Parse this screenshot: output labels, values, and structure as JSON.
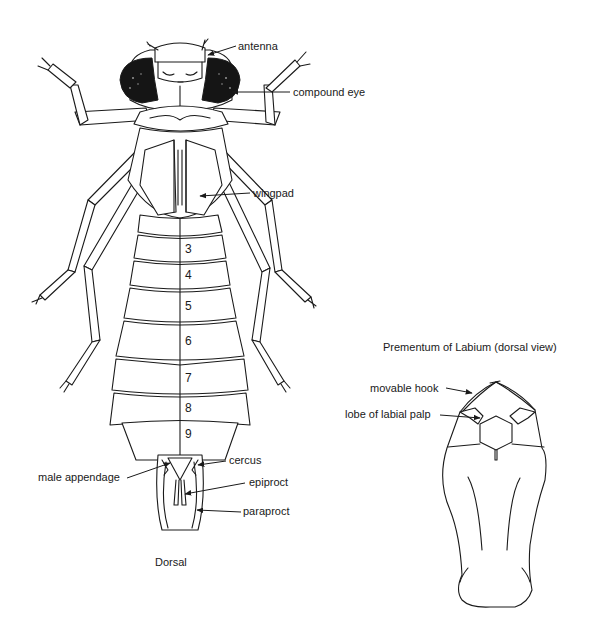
{
  "figure": {
    "dorsal_view": {
      "caption": "Dorsal",
      "labels": {
        "antenna": "antenna",
        "compound_eye": "compound eye",
        "wingpad": "wingpad",
        "male_appendage": "male appendage",
        "cercus": "cercus",
        "epiproct": "epiproct",
        "paraproct": "paraproct"
      },
      "abdominal_segments": [
        "3",
        "4",
        "5",
        "6",
        "7",
        "8",
        "9"
      ]
    },
    "labium_view": {
      "title": "Prementum of Labium (dorsal view)",
      "labels": {
        "movable_hook": "movable hook",
        "lobe_of_labial_palp": "lobe of labial palp"
      }
    },
    "colors": {
      "ink": "#1a1a1a",
      "background": "#ffffff"
    }
  }
}
